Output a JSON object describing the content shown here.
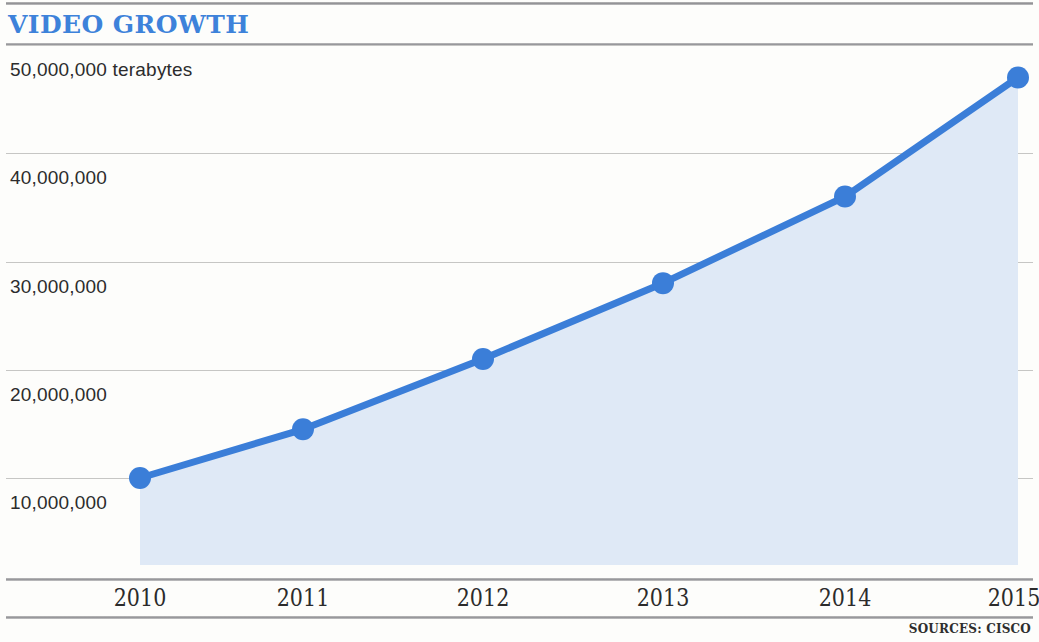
{
  "header": {
    "title": "VIDEO GROWTH"
  },
  "footer": {
    "sources": "SOURCES: CISCO"
  },
  "colors": {
    "line": "#3b7ed8",
    "marker": "#3b7ed8",
    "area_fill": "#dfe9f6",
    "title": "#3d82da",
    "gridline": "#c6c6c4",
    "rule": "#949498",
    "background": "#fdfdfb",
    "text": "#2c2c2c"
  },
  "chart_data": {
    "type": "area",
    "title": "VIDEO GROWTH",
    "xlabel": "",
    "ylabel": "terabytes",
    "categories": [
      "2010",
      "2011",
      "2012",
      "2013",
      "2014",
      "2015"
    ],
    "x": [
      2010,
      2011,
      2012,
      2013,
      2014,
      2015
    ],
    "values": [
      10000000,
      14500000,
      21000000,
      28000000,
      36000000,
      47000000
    ],
    "series": [
      {
        "name": "Video traffic",
        "values": [
          10000000,
          14500000,
          21000000,
          28000000,
          36000000,
          47000000
        ]
      }
    ],
    "ylim": [
      0,
      50000000
    ],
    "yticks": [
      10000000,
      20000000,
      30000000,
      40000000,
      50000000
    ],
    "ytick_labels": [
      "10,000,000",
      "20,000,000",
      "30,000,000",
      "40,000,000",
      "50,000,000 terabytes"
    ],
    "xtick_labels": [
      "2010",
      "2011",
      "2012",
      "2013",
      "2014",
      "2015"
    ],
    "grid": true,
    "legend": "none",
    "units": "terabytes",
    "annotations": [
      "SOURCES: CISCO"
    ]
  }
}
